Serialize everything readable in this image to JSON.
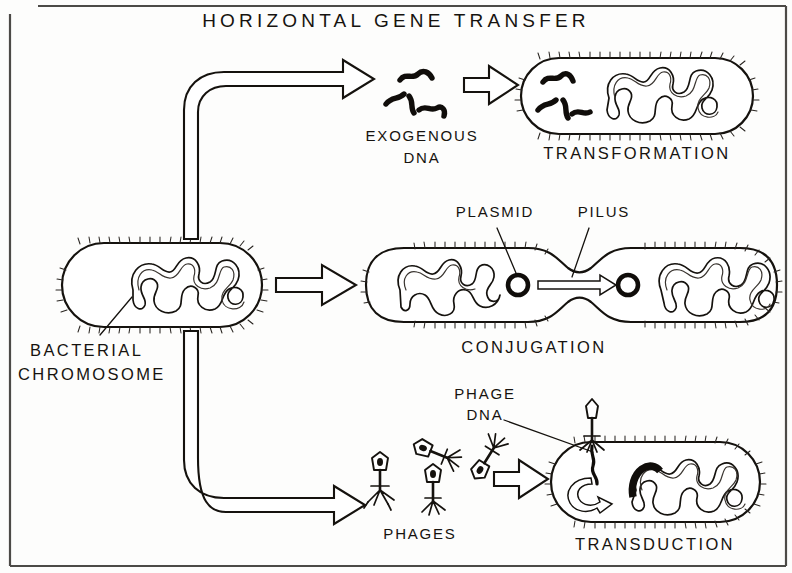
{
  "figure": {
    "title": "HORIZONTAL GENE TRANSFER",
    "style": "hand-drawn black-and-white scientific illustration",
    "background_color": "#fdfdfc",
    "ink_color": "#15120e"
  },
  "labels": {
    "title": "HORIZONTAL GENE TRANSFER",
    "source_cell_line1": "BACTERIAL",
    "source_cell_line2": "CHROMOSOME",
    "exogenous_line1": "EXOGENOUS",
    "exogenous_line2": "DNA",
    "transformation": "TRANSFORMATION",
    "plasmid": "PLASMID",
    "pilus": "PILUS",
    "conjugation": "CONJUGATION",
    "phage_dna_line1": "PHAGE",
    "phage_dna_line2": "DNA",
    "phages": "PHAGES",
    "transduction": "TRANSDUCTION"
  },
  "pathways": [
    {
      "id": "transformation",
      "name": "TRANSFORMATION",
      "position": "top",
      "intermediate": "EXOGENOUS DNA",
      "description": "Free DNA fragments released from a donor cell are taken up by a recipient bacterium",
      "cell_count": 1,
      "dna_fragment_count": 4
    },
    {
      "id": "conjugation",
      "name": "CONJUGATION",
      "position": "middle",
      "intermediate": "PILUS",
      "description": "A plasmid is transferred from donor to recipient cell through a conjugative pilus bridge",
      "cell_count": 2,
      "plasmid_count": 2
    },
    {
      "id": "transduction",
      "name": "TRANSDUCTION",
      "position": "bottom",
      "intermediate": "PHAGES",
      "description": "Bacteriophages inject phage DNA that recombines into the host chromosome",
      "cell_count": 1,
      "phage_count": 4
    }
  ],
  "annotations": [
    {
      "id": "bacterial-chromosome",
      "text": "BACTERIAL CHROMOSOME",
      "points_to": "circular chromosome loop inside donor cell"
    },
    {
      "id": "plasmid",
      "text": "PLASMID",
      "points_to": "small circular plasmid ring in donor cell"
    },
    {
      "id": "pilus",
      "text": "PILUS",
      "points_to": "narrow bridge connecting the two conjugating cells"
    },
    {
      "id": "phage-dna",
      "text": "PHAGE DNA",
      "points_to": "DNA strand injected by the phage into the cell"
    }
  ]
}
